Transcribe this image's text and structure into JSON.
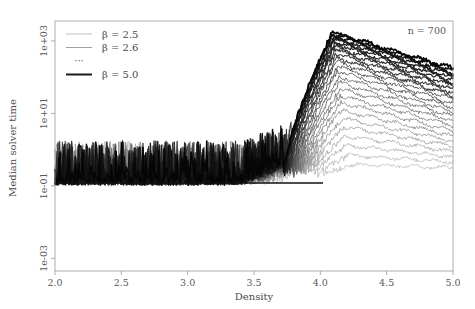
{
  "figure": {
    "width": 475,
    "height": 309,
    "background": "#ffffff"
  },
  "annotations": {
    "top_right": "n = 700"
  },
  "legend": {
    "entries": [
      {
        "label": "β = 2.5",
        "color": "#b8b8b8",
        "width": 0.9
      },
      {
        "label": "β = 2.6",
        "color": "#a0a0a0",
        "width": 1.0
      },
      {
        "label": "···",
        "color": "#8a8a8a",
        "width": 0.9,
        "is_ellipsis": true
      },
      {
        "label": "β = 5.0",
        "color": "#1a1a1a",
        "width": 2.0
      }
    ]
  },
  "chart_data": {
    "type": "line",
    "title": "",
    "xlabel": "Density",
    "ylabel": "Median solver time",
    "xlim": [
      2.0,
      5.0
    ],
    "ylim_log10": [
      -3.35,
      3.55
    ],
    "yscale": "log",
    "xticks": [
      2.0,
      2.5,
      3.0,
      3.5,
      4.0,
      4.5,
      5.0
    ],
    "xtick_labels": [
      "2.0",
      "2.5",
      "3.0",
      "3.5",
      "4.0",
      "4.5",
      "5.0"
    ],
    "yticks_log10": [
      3,
      1,
      -1,
      -3
    ],
    "ytick_labels": [
      "1e+03",
      "1e+01",
      "1e-01",
      "1e-03"
    ],
    "grid": false,
    "legend_position": "top-left",
    "n_instances": 700,
    "beta_values": [
      2.5,
      2.6,
      2.7,
      2.8,
      2.9,
      3.0,
      3.1,
      3.2,
      3.3,
      3.4,
      3.5,
      3.6,
      3.7,
      3.8,
      3.9,
      4.0,
      4.1,
      4.2,
      4.3,
      4.4,
      4.5,
      4.6,
      4.7,
      4.8,
      4.9,
      5.0
    ],
    "series_description": "Median solver time versus clause density for 26 values of the parameter beta; each curve rises steeply near density 3.7-4.1, peaks just above 1e+03 around density 4.1, then decays toward density 5.0. Lower beta curves are lighter and stay near the 1e-01 noise floor.",
    "peak_density": 4.1,
    "peak_value_log10": 3.2,
    "noise_floor_log10": -0.8,
    "series": [
      {
        "name": "β = 2.5",
        "color": "#b9b9b9",
        "width": 0.75,
        "rise_start": 4.02,
        "peak_x": 4.26,
        "peak_log10": -0.42,
        "end_log10": -0.5,
        "floor_log10": -0.86
      },
      {
        "name": "β = 2.6",
        "color": "#b2b2b2",
        "width": 0.75,
        "rise_start": 3.98,
        "peak_x": 4.22,
        "peak_log10": -0.16,
        "end_log10": -0.34,
        "floor_log10": -0.86
      },
      {
        "name": "β = 2.7",
        "color": "#ababab",
        "width": 0.78,
        "rise_start": 3.95,
        "peak_x": 4.2,
        "peak_log10": 0.12,
        "end_log10": -0.2,
        "floor_log10": -0.86
      },
      {
        "name": "β = 2.8",
        "color": "#a3a3a3",
        "width": 0.78,
        "rise_start": 3.93,
        "peak_x": 4.19,
        "peak_log10": 0.38,
        "end_log10": -0.05,
        "floor_log10": -0.86
      },
      {
        "name": "β = 2.9",
        "color": "#9c9c9c",
        "width": 0.8,
        "rise_start": 3.91,
        "peak_x": 4.18,
        "peak_log10": 0.62,
        "end_log10": 0.1,
        "floor_log10": -0.86
      },
      {
        "name": "β = 3.0",
        "color": "#949494",
        "width": 0.8,
        "rise_start": 3.89,
        "peak_x": 4.17,
        "peak_log10": 0.86,
        "end_log10": 0.24,
        "floor_log10": -0.86
      },
      {
        "name": "β = 3.1",
        "color": "#8c8c8c",
        "width": 0.82,
        "rise_start": 3.87,
        "peak_x": 4.16,
        "peak_log10": 1.08,
        "end_log10": 0.38,
        "floor_log10": -0.86
      },
      {
        "name": "β = 3.2",
        "color": "#848484",
        "width": 0.85,
        "rise_start": 3.86,
        "peak_x": 4.16,
        "peak_log10": 1.3,
        "end_log10": 0.52,
        "floor_log10": -0.86
      },
      {
        "name": "β = 3.3",
        "color": "#7c7c7c",
        "width": 0.85,
        "rise_start": 3.85,
        "peak_x": 4.15,
        "peak_log10": 1.5,
        "end_log10": 0.66,
        "floor_log10": -0.86
      },
      {
        "name": "β = 3.4",
        "color": "#757575",
        "width": 0.88,
        "rise_start": 3.84,
        "peak_x": 4.15,
        "peak_log10": 1.68,
        "end_log10": 0.79,
        "floor_log10": -0.86
      },
      {
        "name": "β = 3.5",
        "color": "#6d6d6d",
        "width": 0.9,
        "rise_start": 3.83,
        "peak_x": 4.14,
        "peak_log10": 1.86,
        "end_log10": 0.92,
        "floor_log10": -0.86
      },
      {
        "name": "β = 3.6",
        "color": "#656565",
        "width": 0.92,
        "rise_start": 3.82,
        "peak_x": 4.14,
        "peak_log10": 2.02,
        "end_log10": 1.04,
        "floor_log10": -0.86
      },
      {
        "name": "β = 3.7",
        "color": "#5d5d5d",
        "width": 0.95,
        "rise_start": 3.81,
        "peak_x": 4.13,
        "peak_log10": 2.17,
        "end_log10": 1.16,
        "floor_log10": -0.86
      },
      {
        "name": "β = 3.8",
        "color": "#565656",
        "width": 0.98,
        "rise_start": 3.8,
        "peak_x": 4.13,
        "peak_log10": 2.3,
        "end_log10": 1.27,
        "floor_log10": -0.86
      },
      {
        "name": "β = 3.9",
        "color": "#4e4e4e",
        "width": 1.0,
        "rise_start": 3.79,
        "peak_x": 4.12,
        "peak_log10": 2.43,
        "end_log10": 1.38,
        "floor_log10": -0.86
      },
      {
        "name": "β = 4.0",
        "color": "#464646",
        "width": 1.05,
        "rise_start": 3.78,
        "peak_x": 4.12,
        "peak_log10": 2.55,
        "end_log10": 1.48,
        "floor_log10": -0.86
      },
      {
        "name": "β = 4.1",
        "color": "#3f3f3f",
        "width": 1.08,
        "rise_start": 3.77,
        "peak_x": 4.12,
        "peak_log10": 2.66,
        "end_log10": 1.58,
        "floor_log10": -0.86
      },
      {
        "name": "β = 4.2",
        "color": "#373737",
        "width": 1.12,
        "rise_start": 3.76,
        "peak_x": 4.11,
        "peak_log10": 2.76,
        "end_log10": 1.67,
        "floor_log10": -0.86
      },
      {
        "name": "β = 4.3",
        "color": "#303030",
        "width": 1.15,
        "rise_start": 3.76,
        "peak_x": 4.11,
        "peak_log10": 2.85,
        "end_log10": 1.76,
        "floor_log10": -0.86
      },
      {
        "name": "β = 4.4",
        "color": "#2a2a2a",
        "width": 1.2,
        "rise_start": 3.75,
        "peak_x": 4.11,
        "peak_log10": 2.93,
        "end_log10": 1.84,
        "floor_log10": -0.86
      },
      {
        "name": "β = 4.5",
        "color": "#252525",
        "width": 1.25,
        "rise_start": 3.74,
        "peak_x": 4.1,
        "peak_log10": 3.0,
        "end_log10": 1.92,
        "floor_log10": -0.86
      },
      {
        "name": "β = 4.6",
        "color": "#202020",
        "width": 1.3,
        "rise_start": 3.74,
        "peak_x": 4.1,
        "peak_log10": 3.06,
        "end_log10": 1.99,
        "floor_log10": -0.86
      },
      {
        "name": "β = 4.7",
        "color": "#1b1b1b",
        "width": 1.35,
        "rise_start": 3.73,
        "peak_x": 4.1,
        "peak_log10": 3.11,
        "end_log10": 2.06,
        "floor_log10": -0.86
      },
      {
        "name": "β = 4.8",
        "color": "#161616",
        "width": 1.4,
        "rise_start": 3.73,
        "peak_x": 4.09,
        "peak_log10": 3.16,
        "end_log10": 2.12,
        "floor_log10": -0.86
      },
      {
        "name": "β = 4.9",
        "color": "#101010",
        "width": 1.5,
        "rise_start": 3.72,
        "peak_x": 4.09,
        "peak_log10": 3.2,
        "end_log10": 2.18,
        "floor_log10": -0.86
      },
      {
        "name": "β = 5.0",
        "color": "#060606",
        "width": 1.7,
        "rise_start": 3.72,
        "peak_x": 4.09,
        "peak_log10": 3.24,
        "end_log10": 2.24,
        "floor_log10": -0.86
      }
    ]
  }
}
